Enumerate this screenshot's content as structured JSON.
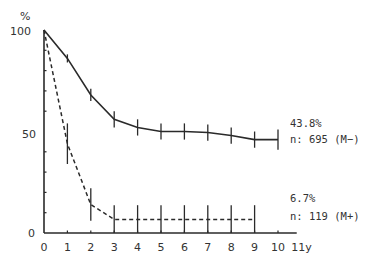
{
  "chart_data": {
    "type": "line",
    "title": "",
    "xlabel": "y",
    "ylabel": "%",
    "x_unit_label": "11y",
    "xlim": [
      0,
      11
    ],
    "ylim": [
      0,
      100
    ],
    "x_ticks": [
      "0",
      "1",
      "2",
      "3",
      "4",
      "5",
      "6",
      "7",
      "8",
      "9",
      "10",
      "11y"
    ],
    "y_tick_labels": [
      "0",
      "50",
      "100"
    ],
    "y_minor_ticks": [
      10,
      20,
      30,
      40,
      60,
      70,
      80,
      90
    ],
    "grid": false,
    "series": [
      {
        "name": "M-",
        "style": "solid",
        "n_label": "n: 695 (M−)",
        "end_label": "43.8%",
        "x": [
          0,
          1,
          2,
          3,
          4,
          5,
          6,
          7,
          8,
          9,
          10
        ],
        "values": [
          100,
          86,
          68,
          56,
          52,
          50,
          50,
          49.5,
          48,
          46,
          46
        ],
        "error_half": [
          0,
          2,
          3,
          4,
          4,
          4,
          4,
          4,
          4,
          4,
          5
        ]
      },
      {
        "name": "M+",
        "style": "dashed",
        "n_label": "n: 119 (M+)",
        "end_label": "6.7%",
        "x": [
          0,
          1,
          2,
          3,
          4,
          5,
          6,
          7,
          8,
          9
        ],
        "values": [
          100,
          44,
          14,
          6.7,
          6.7,
          6.7,
          6.7,
          6.7,
          6.7,
          6.7
        ],
        "error_half": [
          0,
          10,
          8,
          7,
          7,
          7,
          7,
          7,
          7,
          7
        ]
      }
    ]
  },
  "labels": {
    "y_unit": "%",
    "y_100": "100",
    "y_50": "50",
    "y_0": "0",
    "m_minus_pct": "43.8%",
    "m_minus_n": "n: 695 (M−)",
    "m_plus_pct": "6.7%",
    "m_plus_n": "n: 119 (M+)"
  }
}
